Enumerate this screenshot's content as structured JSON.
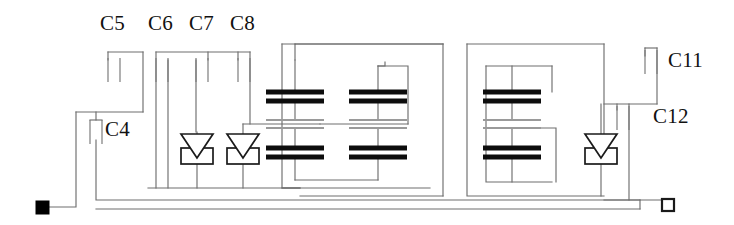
{
  "diagram": {
    "background_color": "#ffffff",
    "wire_color": "#6e6e6e",
    "plate_color": "#0d0d0d",
    "label_color": "#111111",
    "width": 734,
    "height": 225
  },
  "labels": [
    {
      "id": "c5",
      "text": "C5",
      "x": 100,
      "y": 30
    },
    {
      "id": "c6",
      "text": "C6",
      "x": 148,
      "y": 30
    },
    {
      "id": "c7",
      "text": "C7",
      "x": 189,
      "y": 30
    },
    {
      "id": "c8",
      "text": "C8",
      "x": 230,
      "y": 30
    },
    {
      "id": "c4",
      "text": "C4",
      "x": 105,
      "y": 136
    },
    {
      "id": "c11",
      "text": "C11",
      "x": 668,
      "y": 67
    },
    {
      "id": "c12",
      "text": "C12",
      "x": 653,
      "y": 123
    }
  ],
  "components": {
    "capacitors_small": [
      {
        "name": "C5",
        "plate_left_x": 108,
        "plate_right_x": 120,
        "top_y": 52,
        "bottom_y": 80
      },
      {
        "name": "C6",
        "plate_left_x": 156,
        "plate_right_x": 168,
        "top_y": 52,
        "bottom_y": 80
      },
      {
        "name": "C7",
        "plate_left_x": 196,
        "plate_right_x": 208,
        "top_y": 52,
        "bottom_y": 80
      },
      {
        "name": "C8",
        "plate_left_x": 238,
        "plate_right_x": 250,
        "top_y": 52,
        "bottom_y": 80
      },
      {
        "name": "C4",
        "plate_left_x": 90,
        "plate_right_x": 102,
        "top_y": 120,
        "bottom_y": 148
      },
      {
        "name": "C11",
        "plate_left_x": 645,
        "plate_right_x": 657,
        "top_y": 48,
        "bottom_y": 76
      },
      {
        "name": "C12",
        "plate_left_x": 617,
        "plate_right_x": 629,
        "top_y": 102,
        "bottom_y": 130
      }
    ],
    "capacitor_stacks": [
      {
        "name": "stack-1",
        "center_x": 295,
        "top_y": 88
      },
      {
        "name": "stack-2",
        "center_x": 378,
        "top_y": 88
      },
      {
        "name": "stack-3",
        "center_x": 512,
        "top_y": 88
      }
    ],
    "diodes": [
      {
        "name": "diode-1",
        "center_x": 197,
        "center_y": 148
      },
      {
        "name": "diode-2",
        "center_x": 243,
        "center_y": 148
      },
      {
        "name": "diode-3",
        "center_x": 601,
        "center_y": 148
      }
    ],
    "terminals": [
      {
        "name": "terminal-left",
        "style": "filled",
        "x": 42,
        "y": 207
      },
      {
        "name": "terminal-right",
        "style": "hollow",
        "x": 668,
        "y": 205
      }
    ]
  }
}
